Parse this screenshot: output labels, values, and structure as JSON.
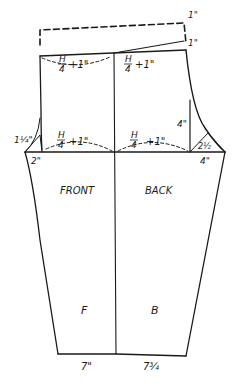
{
  "diagram": {
    "type": "sewing-pattern-draft",
    "colors": {
      "ink": "#1a1a1a",
      "background": "#ffffff"
    },
    "labels": {
      "front": "FRONT",
      "back": "BACK",
      "front_short": "F",
      "back_short": "B"
    },
    "measurements": {
      "waist_extension_top": "1\"",
      "waist_rise_back": "1\"",
      "front_waist": {
        "num": "H",
        "den": "4",
        "plus": "+1\""
      },
      "back_waist": {
        "num": "H",
        "den": "4",
        "plus": "+1\""
      },
      "front_hip": {
        "num": "H",
        "den": "4",
        "plus": "+1\""
      },
      "back_hip": {
        "num": "H",
        "den": "4",
        "plus": "+1\""
      },
      "front_crotch_diagonal": "1¼\"",
      "front_crotch_extension": "2\"",
      "back_vertical": "4\"",
      "back_crotch_diagonal": "2½",
      "back_crotch_extension": "4\"",
      "front_hem": "7\"",
      "back_hem": "7¾"
    }
  }
}
